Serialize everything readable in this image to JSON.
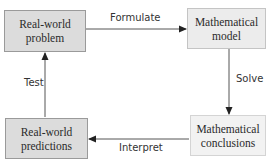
{
  "diagram": {
    "nodes": [
      {
        "id": "real-world-problem",
        "lines": [
          "Real-world",
          "problem"
        ]
      },
      {
        "id": "mathematical-model",
        "lines": [
          "Mathematical",
          "model"
        ]
      },
      {
        "id": "mathematical-conclusions",
        "lines": [
          "Mathematical",
          "conclusions"
        ]
      },
      {
        "id": "real-world-predictions",
        "lines": [
          "Real-world",
          "predictions"
        ]
      }
    ],
    "edges": [
      {
        "from": "real-world-problem",
        "to": "mathematical-model",
        "label": "Formulate"
      },
      {
        "from": "mathematical-model",
        "to": "mathematical-conclusions",
        "label": "Solve"
      },
      {
        "from": "mathematical-conclusions",
        "to": "real-world-predictions",
        "label": "Interpret"
      },
      {
        "from": "real-world-predictions",
        "to": "real-world-problem",
        "label": "Test"
      }
    ],
    "colors": {
      "line": "#555555",
      "box_dark": "#dcdcdc",
      "box_light": "#ececec",
      "box_lighter": "#f2f2f2"
    }
  }
}
